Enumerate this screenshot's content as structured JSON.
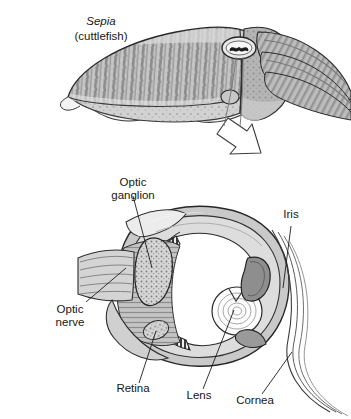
{
  "figure": {
    "title_species": "Sepia",
    "title_common": "(cuttlefish)",
    "background_color": "#ffffff",
    "ink_color": "#1a1a1a"
  },
  "top_illustration": {
    "name": "cuttlefish-lateral-view",
    "description": "Lateral view of a cuttlefish with striped mantle, undulating lateral fin, head with eye and tapering arms",
    "eye_feature": "w-shaped-pupil",
    "palette": {
      "mantle_light": "#cfcfcf",
      "mantle_mid": "#a8a8a8",
      "mantle_dark": "#7c7c7c",
      "fin_light": "#efefef",
      "outline": "#2a2a2a"
    }
  },
  "connector": {
    "name": "magnify-arrow",
    "shape": "hollow-block-arrow",
    "direction": "down-left",
    "fill": "#ffffff",
    "stroke": "#3a3a3a"
  },
  "bottom_illustration": {
    "name": "cephalopod-eye-cross-section",
    "description": "Cross-section through the cuttlefish eye showing optic nerve, optic ganglion, retina, lens, iris and cornea",
    "palette": {
      "tissue_light": "#d8d8d8",
      "tissue_mid": "#b0b0b0",
      "tissue_dark": "#8a8a8a",
      "tissue_darkest": "#6a6a6a",
      "lens_fill": "#fdfdfd",
      "chamber_fill": "#ffffff",
      "outline": "#262626"
    }
  },
  "labels": [
    {
      "id": "optic-ganglion",
      "text_line1": "Optic",
      "text_line2": "ganglion",
      "x": 133,
      "y": 186
    },
    {
      "id": "iris",
      "text_line1": "Iris",
      "text_line2": "",
      "x": 291,
      "y": 218
    },
    {
      "id": "optic-nerve",
      "text_line1": "Optic",
      "text_line2": "nerve",
      "x": 70,
      "y": 313
    },
    {
      "id": "retina",
      "text_line1": "Retina",
      "text_line2": "",
      "x": 133,
      "y": 392
    },
    {
      "id": "lens",
      "text_line1": "Lens",
      "text_line2": "",
      "x": 199,
      "y": 399
    },
    {
      "id": "cornea",
      "text_line1": "Cornea",
      "text_line2": "",
      "x": 255,
      "y": 404
    }
  ]
}
